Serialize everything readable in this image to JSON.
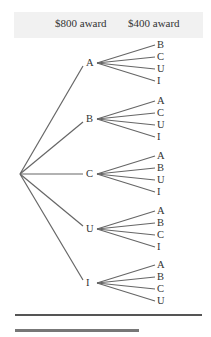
{
  "header": {
    "col1": "$800 award",
    "col2": "$400 award"
  },
  "tree": {
    "root": {
      "x": 20,
      "y": 174
    },
    "first_level_x": 88,
    "second_level_x": 155,
    "nodes": [
      {
        "label": "A",
        "y": 63,
        "children": [
          "B",
          "C",
          "U",
          "I"
        ]
      },
      {
        "label": "B",
        "y": 119,
        "children": [
          "A",
          "C",
          "U",
          "I"
        ]
      },
      {
        "label": "C",
        "y": 174,
        "children": [
          "A",
          "B",
          "U",
          "I"
        ]
      },
      {
        "label": "U",
        "y": 229,
        "children": [
          "A",
          "B",
          "C",
          "I"
        ]
      },
      {
        "label": "I",
        "y": 283,
        "children": [
          "A",
          "B",
          "C",
          "U"
        ]
      }
    ]
  },
  "colors": {
    "line": "#666666",
    "header_bg": "#f1f1f1",
    "text": "#333333"
  }
}
